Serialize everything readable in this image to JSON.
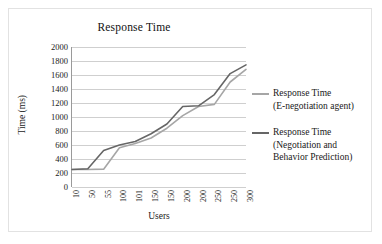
{
  "chart_data": {
    "type": "line",
    "title": "Response Time",
    "xlabel": "Users",
    "ylabel": "Time (ms)",
    "categories": [
      "10",
      "50",
      "55",
      "100",
      "101",
      "150",
      "150",
      "200",
      "200",
      "250",
      "250",
      "300"
    ],
    "ylim": [
      0,
      2000
    ],
    "yticks": [
      0,
      200,
      400,
      600,
      800,
      1000,
      1200,
      1400,
      1600,
      1800,
      2000
    ],
    "grid": true,
    "legend_position": "right",
    "series": [
      {
        "name": "Response Time (E-negotiation agent)",
        "name_line1": "Response Time",
        "name_line2": "(E-negotiation agent)",
        "color": "#a6a6a6",
        "values": [
          250,
          250,
          255,
          560,
          620,
          700,
          840,
          1020,
          1150,
          1180,
          1500,
          1680
        ]
      },
      {
        "name": "Response Time (Negotiation and Behavior Prediction)",
        "name_line1": "Response Time",
        "name_line2": "(Negotiation and",
        "name_line3": "Behavior Prediction)",
        "color": "#666666",
        "values": [
          250,
          260,
          520,
          600,
          650,
          760,
          900,
          1150,
          1160,
          1320,
          1620,
          1745
        ]
      }
    ]
  }
}
